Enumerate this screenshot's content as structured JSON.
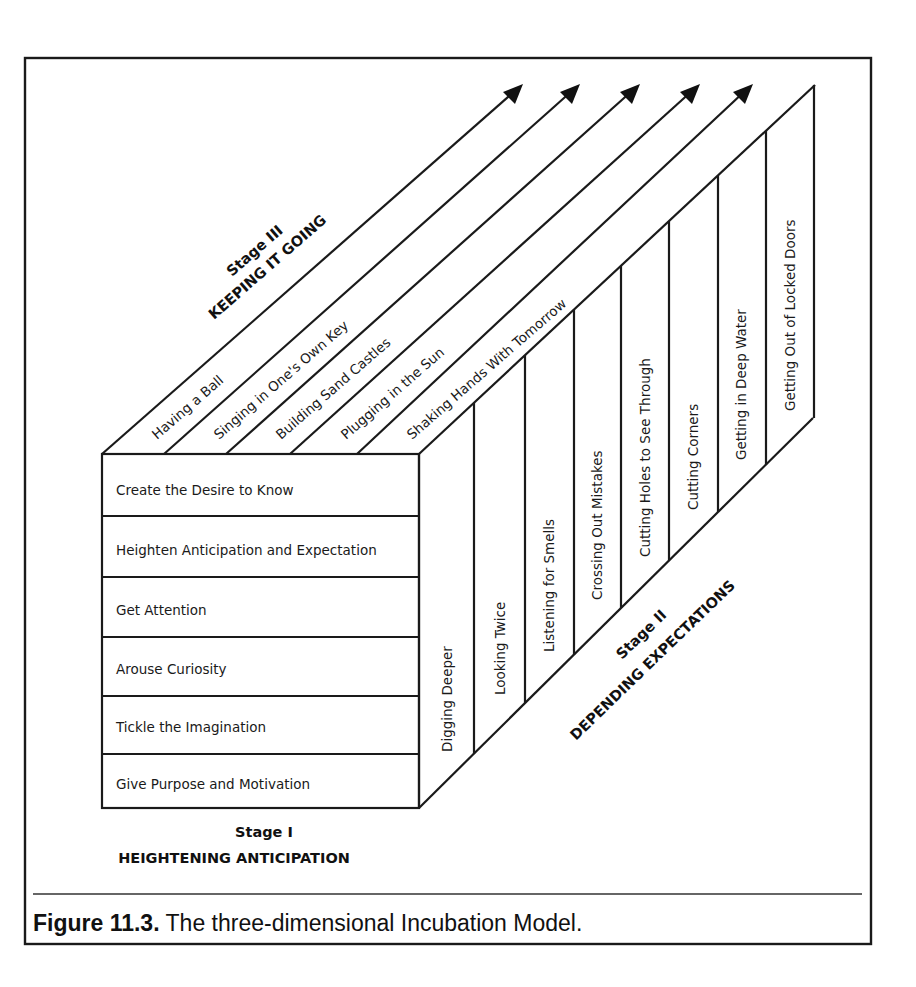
{
  "figure": {
    "caption_label": "Figure 11.3.",
    "caption_text": " The three-dimensional Incubation Model."
  },
  "stage1": {
    "title": "Stage I",
    "subtitle": "HEIGHTENING ANTICIPATION",
    "rows": [
      "Create the Desire to Know",
      "Heighten Anticipation and Expectation",
      "Get Attention",
      "Arouse Curiosity",
      "Tickle the Imagination",
      "Give Purpose and Motivation"
    ]
  },
  "stage2": {
    "title": "Stage II",
    "subtitle": "DEPENDING EXPECTATIONS",
    "columns": [
      "Digging Deeper",
      "Looking Twice",
      "Listening for Smells",
      "Crossing Out Mistakes",
      "Cutting Holes to See Through",
      "Cutting Corners",
      "Getting in Deep Water",
      "Getting Out of Locked Doors"
    ]
  },
  "stage3": {
    "title": "Stage III",
    "subtitle": "KEEPING IT GOING",
    "strips": [
      "Having a Ball",
      "Singing in One's Own Key",
      "Building Sand Castles",
      "Plugging in the Sun",
      "Shaking Hands With Tomorrow"
    ]
  }
}
